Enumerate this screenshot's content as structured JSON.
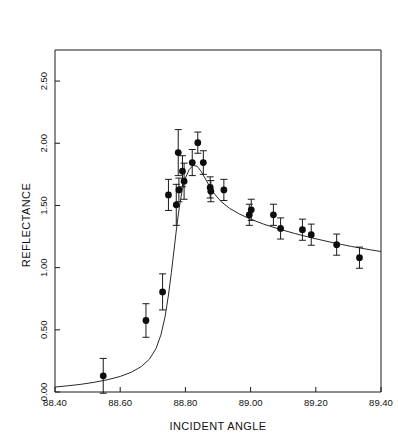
{
  "chart_data": {
    "type": "scatter",
    "title": "",
    "xlabel": "INCIDENT ANGLE",
    "ylabel": "REFLECTANCE",
    "xlim": [
      88.4,
      89.4
    ],
    "ylim": [
      0.0,
      2.75
    ],
    "grid": false,
    "legend": null,
    "xticks": [
      88.4,
      88.6,
      88.8,
      89.0,
      89.2,
      89.4
    ],
    "xticklabels": [
      "88.40",
      "88.60",
      "88.80",
      "89.00",
      "89.20",
      "89.40"
    ],
    "yticks": [
      0.0,
      0.5,
      1.0,
      1.5,
      2.0,
      2.5
    ],
    "yticklabels": [
      "0.00",
      "0.50",
      "1.00",
      "1.50",
      "2.00",
      "2.50"
    ],
    "series": [
      {
        "name": "measured reflectance",
        "marker": "filled-circle",
        "has_error_bars": true,
        "error_direction": "y",
        "points": [
          {
            "x": 88.548,
            "y": 0.13,
            "yerr": 0.14
          },
          {
            "x": 88.679,
            "y": 0.575,
            "yerr": 0.135
          },
          {
            "x": 88.73,
            "y": 0.805,
            "yerr": 0.145
          },
          {
            "x": 88.748,
            "y": 1.585,
            "yerr": 0.125
          },
          {
            "x": 88.772,
            "y": 1.505,
            "yerr": 0.165
          },
          {
            "x": 88.778,
            "y": 1.925,
            "yerr": 0.185
          },
          {
            "x": 88.78,
            "y": 1.625,
            "yerr": 0.095
          },
          {
            "x": 88.791,
            "y": 1.775,
            "yerr": 0.125
          },
          {
            "x": 88.796,
            "y": 1.695,
            "yerr": 0.145
          },
          {
            "x": 88.821,
            "y": 1.845,
            "yerr": 0.105
          },
          {
            "x": 88.838,
            "y": 2.005,
            "yerr": 0.085
          },
          {
            "x": 88.855,
            "y": 1.845,
            "yerr": 0.095
          },
          {
            "x": 88.876,
            "y": 1.645,
            "yerr": 0.085
          },
          {
            "x": 88.878,
            "y": 1.615,
            "yerr": 0.085
          },
          {
            "x": 88.918,
            "y": 1.625,
            "yerr": 0.085
          },
          {
            "x": 88.996,
            "y": 1.425,
            "yerr": 0.085
          },
          {
            "x": 89.002,
            "y": 1.465,
            "yerr": 0.085
          },
          {
            "x": 89.07,
            "y": 1.425,
            "yerr": 0.085
          },
          {
            "x": 89.092,
            "y": 1.315,
            "yerr": 0.085
          },
          {
            "x": 89.159,
            "y": 1.305,
            "yerr": 0.085
          },
          {
            "x": 89.186,
            "y": 1.265,
            "yerr": 0.085
          },
          {
            "x": 89.264,
            "y": 1.185,
            "yerr": 0.085
          },
          {
            "x": 89.334,
            "y": 1.08,
            "yerr": 0.085
          }
        ]
      },
      {
        "name": "fitted curve",
        "marker": "none",
        "line": "solid",
        "curve": [
          {
            "x": 88.4,
            "y": 0.04
          },
          {
            "x": 88.44,
            "y": 0.05
          },
          {
            "x": 88.48,
            "y": 0.062
          },
          {
            "x": 88.52,
            "y": 0.078
          },
          {
            "x": 88.56,
            "y": 0.098
          },
          {
            "x": 88.6,
            "y": 0.125
          },
          {
            "x": 88.635,
            "y": 0.16
          },
          {
            "x": 88.665,
            "y": 0.205
          },
          {
            "x": 88.69,
            "y": 0.265
          },
          {
            "x": 88.71,
            "y": 0.35
          },
          {
            "x": 88.725,
            "y": 0.46
          },
          {
            "x": 88.738,
            "y": 0.61
          },
          {
            "x": 88.748,
            "y": 0.78
          },
          {
            "x": 88.757,
            "y": 0.96
          },
          {
            "x": 88.765,
            "y": 1.14
          },
          {
            "x": 88.773,
            "y": 1.32
          },
          {
            "x": 88.781,
            "y": 1.48
          },
          {
            "x": 88.79,
            "y": 1.62
          },
          {
            "x": 88.8,
            "y": 1.72
          },
          {
            "x": 88.812,
            "y": 1.79
          },
          {
            "x": 88.824,
            "y": 1.822
          },
          {
            "x": 88.836,
            "y": 1.815
          },
          {
            "x": 88.848,
            "y": 1.775
          },
          {
            "x": 88.86,
            "y": 1.72
          },
          {
            "x": 88.874,
            "y": 1.655
          },
          {
            "x": 88.89,
            "y": 1.59
          },
          {
            "x": 88.91,
            "y": 1.53
          },
          {
            "x": 88.935,
            "y": 1.478
          },
          {
            "x": 88.965,
            "y": 1.432
          },
          {
            "x": 89.0,
            "y": 1.39
          },
          {
            "x": 89.04,
            "y": 1.35
          },
          {
            "x": 89.085,
            "y": 1.312
          },
          {
            "x": 89.135,
            "y": 1.275
          },
          {
            "x": 89.19,
            "y": 1.238
          },
          {
            "x": 89.25,
            "y": 1.202
          },
          {
            "x": 89.31,
            "y": 1.17
          },
          {
            "x": 89.37,
            "y": 1.142
          },
          {
            "x": 89.4,
            "y": 1.13
          }
        ]
      }
    ]
  }
}
